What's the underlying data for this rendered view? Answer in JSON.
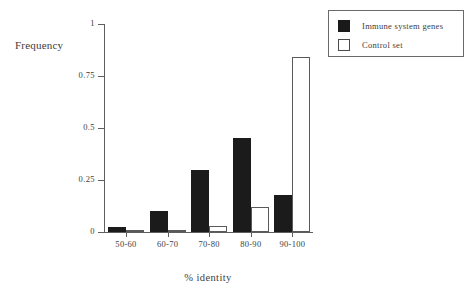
{
  "chart_data": {
    "type": "bar",
    "title": "",
    "xlabel": "% identity",
    "ylabel": "Frequency",
    "categories": [
      "50-60",
      "60-70",
      "70-80",
      "80-90",
      "90-100"
    ],
    "series": [
      {
        "name": "Immune system genes",
        "color": "#1b1b1b",
        "fill": "solid",
        "values": [
          0.025,
          0.1,
          0.3,
          0.45,
          0.18
        ]
      },
      {
        "name": "Control set",
        "color": "#ffffff",
        "fill": "hollow",
        "values": [
          0.005,
          0.01,
          0.03,
          0.12,
          0.84
        ]
      }
    ],
    "ylim": [
      0,
      1
    ],
    "yticks": [
      0,
      0.25,
      0.5,
      0.75,
      1
    ],
    "ytick_labels": [
      "0",
      "0.25",
      "0.5",
      "0.75",
      "1"
    ],
    "grid": false,
    "legend_position": "top-right"
  },
  "legend": {
    "entries": [
      {
        "label": "Immune system genes",
        "swatch": "filled-square-icon"
      },
      {
        "label": "Control set",
        "swatch": "hollow-square-icon"
      }
    ]
  }
}
